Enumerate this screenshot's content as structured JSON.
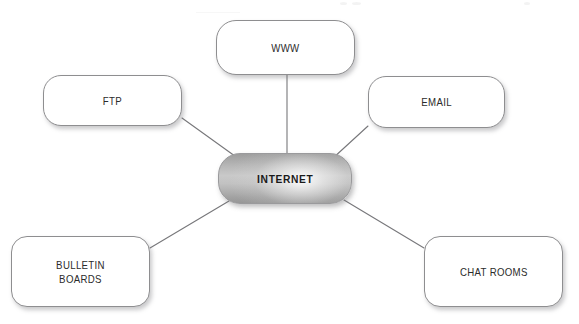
{
  "diagram": {
    "title": "INTERNET",
    "type": "hub-and-spoke",
    "background_color": "#ffffff",
    "hub": {
      "id": "internet",
      "label": "INTERNET",
      "fill_style": "gray-gradient",
      "gradient_light": "#cacaca",
      "gradient_dark": "#979797",
      "text_color": "#1a1a1a",
      "bold": true
    },
    "nodes": [
      {
        "id": "www",
        "label": "WWW",
        "position": "top-center",
        "fill": "#ffffff",
        "border_color": "#8e8e90"
      },
      {
        "id": "ftp",
        "label": "FTP",
        "position": "top-left",
        "fill": "#ffffff",
        "border_color": "#8e8e90"
      },
      {
        "id": "email",
        "label": "EMAIL",
        "position": "top-right",
        "fill": "#ffffff",
        "border_color": "#8e8e90"
      },
      {
        "id": "bulletin-boards",
        "label": "BULLETIN\nBOARDS",
        "position": "bottom-left",
        "fill": "#ffffff",
        "border_color": "#8e8e90"
      },
      {
        "id": "chat-rooms",
        "label": "CHAT ROOMS",
        "position": "bottom-right",
        "fill": "#ffffff",
        "border_color": "#8e8e90"
      }
    ],
    "connectors": [
      {
        "from": "internet",
        "to": "www",
        "x1": 287,
        "y1": 160,
        "x2": 287,
        "y2": 74
      },
      {
        "from": "internet",
        "to": "ftp",
        "x1": 239,
        "y1": 159,
        "x2": 182,
        "y2": 118
      },
      {
        "from": "internet",
        "to": "email",
        "x1": 332,
        "y1": 159,
        "x2": 368,
        "y2": 126
      },
      {
        "from": "internet",
        "to": "bulletin-boards",
        "x1": 229,
        "y1": 201,
        "x2": 150,
        "y2": 248
      },
      {
        "from": "internet",
        "to": "chat-rooms",
        "x1": 344,
        "y1": 200,
        "x2": 424,
        "y2": 248
      }
    ],
    "connector_color": "#77777a",
    "connector_width": 1.1
  }
}
